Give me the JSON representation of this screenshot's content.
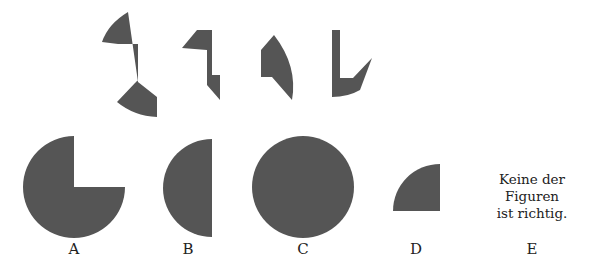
{
  "puzzle": {
    "fill_color": "#555555",
    "pieces": [
      {
        "name": "piece-1"
      },
      {
        "name": "piece-2"
      },
      {
        "name": "piece-3"
      },
      {
        "name": "piece-4"
      }
    ],
    "options": [
      {
        "label": "A",
        "shape": "three-quarter-circle"
      },
      {
        "label": "B",
        "shape": "half-circle"
      },
      {
        "label": "C",
        "shape": "full-circle"
      },
      {
        "label": "D",
        "shape": "quarter-circle"
      },
      {
        "label": "E",
        "text_lines": [
          "Keine der",
          "Figuren",
          "ist richtig."
        ]
      }
    ]
  }
}
